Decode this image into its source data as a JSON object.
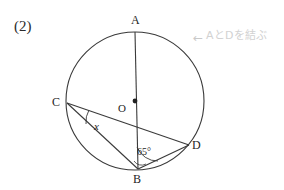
{
  "page": {
    "background_color": "#ffffff",
    "ink_color": "#333333",
    "width": 284,
    "height": 190
  },
  "problem": {
    "number_label": "(2)"
  },
  "annotation": {
    "arrow_glyph": "←",
    "text": "AとDを結ぶ",
    "color": "#d2d2d2"
  },
  "figure": {
    "type": "circle-geometry-diagram",
    "circle": {
      "center_x": 135,
      "center_y": 101,
      "radius": 69,
      "stroke": "#3a3a3a"
    },
    "center_point": {
      "label": "O",
      "x": 135,
      "y": 101
    },
    "points": [
      {
        "id": "A",
        "label": "A",
        "x": 135,
        "y": 32
      },
      {
        "id": "B",
        "label": "B",
        "x": 138,
        "y": 169
      },
      {
        "id": "C",
        "label": "C",
        "x": 67,
        "y": 103
      },
      {
        "id": "D",
        "label": "D",
        "x": 189,
        "y": 145
      }
    ],
    "segments": [
      {
        "id": "AB",
        "from": "A",
        "to": "B"
      },
      {
        "id": "CD",
        "from": "C",
        "to": "D"
      },
      {
        "id": "CB",
        "from": "C",
        "to": "B"
      },
      {
        "id": "BD",
        "from": "B",
        "to": "D"
      }
    ],
    "angles": [
      {
        "id": "angle-at-c",
        "vertex": "C",
        "between": [
          "CB",
          "CD"
        ],
        "label": "x",
        "style": "italic"
      },
      {
        "id": "angle-at-b",
        "vertex": "B",
        "between": [
          "BA",
          "BD"
        ],
        "label": "65°"
      }
    ]
  },
  "labels": {
    "A": "A",
    "B": "B",
    "C": "C",
    "D": "D",
    "O": "O",
    "x": "x",
    "angle_65": "65°"
  }
}
